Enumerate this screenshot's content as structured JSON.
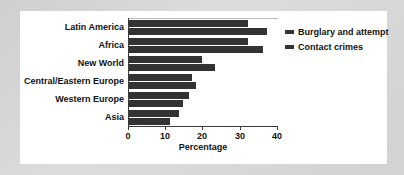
{
  "chart_data": {
    "type": "bar",
    "orientation": "horizontal",
    "title": "",
    "xlabel": "Percentage",
    "ylabel": "",
    "xlim": [
      0,
      40
    ],
    "xticks": [
      0,
      10,
      20,
      30,
      40
    ],
    "xtick_labels": [
      "0",
      "10",
      "20",
      "30",
      "40"
    ],
    "grid": false,
    "legend_position": "right",
    "categories": [
      "Latin America",
      "Africa",
      "New World",
      "Central/Eastern Europe",
      "Western Europe",
      "Asia"
    ],
    "series": [
      {
        "name": "Burglary and attempt",
        "color": "#333333",
        "values": [
          32,
          32,
          19.5,
          17,
          16,
          13.5
        ]
      },
      {
        "name": "Contact crimes",
        "color": "#333333",
        "values": [
          37,
          36,
          23,
          18,
          14.5,
          11
        ]
      }
    ]
  },
  "legend": {
    "items": [
      {
        "label": "Burglary and attempt"
      },
      {
        "label": "Contact crimes"
      }
    ]
  },
  "colors": {
    "bar": "#333333",
    "axis": "#3a3a3a",
    "text": "#111111",
    "plot_background": "#ffffff",
    "page_background": "#d4d4d4"
  }
}
